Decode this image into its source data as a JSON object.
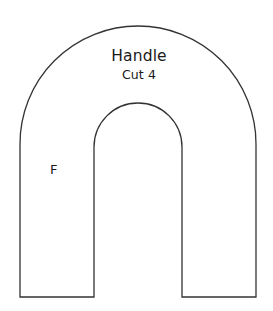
{
  "document": {
    "kind": "sewing-pattern-piece",
    "background_color": "#ffffff",
    "line_color": "#333333"
  },
  "pattern": {
    "title": "Handle",
    "cut_instruction": "Cut 4",
    "fold_marker": "F",
    "shape_name": "inverted-u-arch"
  },
  "geometry": {
    "outer_left_x": 20,
    "outer_right_x": 256,
    "outer_arc_top_y": 26,
    "outer_arc_center_y": 144,
    "outer_radius": 118,
    "inner_left_x": 94,
    "inner_right_x": 182,
    "inner_arc_top_y": 103,
    "inner_arc_center_y": 147,
    "inner_radius": 44,
    "bottom_y": 297,
    "stroke_width": 1.3
  }
}
